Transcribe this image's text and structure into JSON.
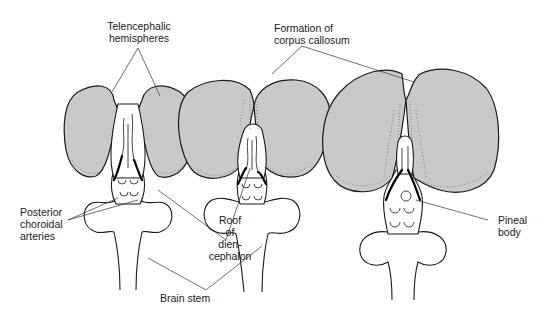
{
  "figure": {
    "colors": {
      "hemisphere_fill": "#c9c9c9",
      "outline": "#1a1a1a",
      "background": "#ffffff"
    },
    "labels": {
      "telencephalic_hemispheres": "Telencephalic\nhemispheres",
      "formation_corpus_callosum": "Formation of\ncorpus callosum",
      "posterior_choroidal_arteries": "Posterior\nchoroidal\narteries",
      "roof_diencephalon": "Roof\nof\ndien-\ncephalon",
      "brain_stem": "Brain stem",
      "pineal_body": "Pineal\nbody"
    },
    "stages": [
      {
        "name": "stage-1"
      },
      {
        "name": "stage-2"
      },
      {
        "name": "stage-3"
      }
    ]
  }
}
